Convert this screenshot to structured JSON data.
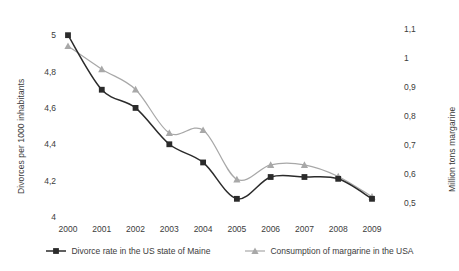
{
  "chart_data": {
    "type": "line",
    "title": "",
    "subtitle": "",
    "xlabel": "",
    "ylabel": "Divorces per 1000 inhabitants",
    "ylabel_secondary": "Million tons margarine",
    "categories": [
      "2000",
      "2001",
      "2002",
      "2003",
      "2004",
      "2005",
      "2006",
      "2007",
      "2008",
      "2009"
    ],
    "x": [
      2000,
      2001,
      2002,
      2003,
      2004,
      2005,
      2006,
      2007,
      2008,
      2009
    ],
    "ylim": [
      4,
      5.1
    ],
    "ylim_secondary": [
      0.45,
      1.14
    ],
    "yticks": [
      "4",
      "4,2",
      "4,4",
      "4,6",
      "4,8",
      "5"
    ],
    "ytick_values": [
      4,
      4.2,
      4.4,
      4.6,
      4.8,
      5
    ],
    "yticks_secondary": [
      "0,5",
      "0,6",
      "0,7",
      "0,8",
      "0,9",
      "1",
      "1,1"
    ],
    "ytick_values_secondary": [
      0.5,
      0.6,
      0.7,
      0.8,
      0.9,
      1.0,
      1.1
    ],
    "grid": false,
    "legend_position": "bottom",
    "smoothing": "spline",
    "series": [
      {
        "name": "Divorce rate in the US state of Maine",
        "axis": "left",
        "color": "#2b2b2b",
        "marker": "square",
        "values": [
          5.0,
          4.7,
          4.6,
          4.4,
          4.3,
          4.1,
          4.22,
          4.22,
          4.21,
          4.1
        ]
      },
      {
        "name": "Consumption of margarine in the USA",
        "axis": "right",
        "color": "#a8a8a8",
        "marker": "triangle",
        "values": [
          1.04,
          0.96,
          0.89,
          0.74,
          0.75,
          0.58,
          0.63,
          0.63,
          0.59,
          0.52
        ]
      }
    ]
  },
  "legend": {
    "items": [
      {
        "label": "Divorce rate in the US state of Maine",
        "marker": "square-marker-icon",
        "color": "#2b2b2b"
      },
      {
        "label": "Consumption of margarine in the USA",
        "marker": "triangle-marker-icon",
        "color": "#a8a8a8"
      }
    ]
  }
}
